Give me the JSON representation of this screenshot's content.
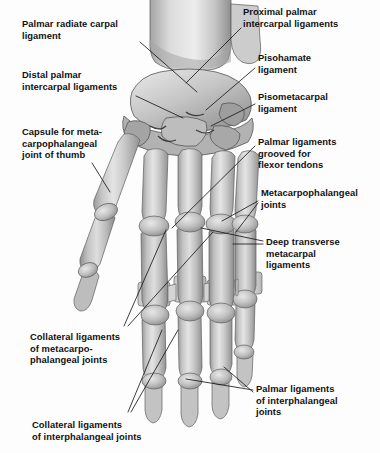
{
  "figure": {
    "background_color": "#fdfdfd",
    "text_color": "#111111",
    "bone_light": "#e2e2e2",
    "bone_mid": "#b8b8b8",
    "bone_dark": "#8e8e8e",
    "outline_color": "#4a4a4a",
    "leader_color": "#1a1a1a",
    "width": 380,
    "height": 453
  },
  "labels": [
    {
      "id": "palmar-radiate-carpal-ligament",
      "text": "Palmar radiate carpal\nligament",
      "side": "left",
      "x": 22,
      "y": 18
    },
    {
      "id": "distal-palmar-intercarpal-ligaments",
      "text": "Distal palmar\nintercarpal ligaments",
      "side": "left",
      "x": 22,
      "y": 69
    },
    {
      "id": "capsule-for-metacarpophalangeal-joint-of-thumb",
      "text": "Capsule for meta-\ncarpophalangeal\njoint of thumb",
      "side": "left",
      "x": 22,
      "y": 126
    },
    {
      "id": "collateral-ligaments-of-metacarpophalangeal-joints",
      "text": "Collateral ligaments\nof metacarpo-\nphalangeal joints",
      "side": "left",
      "x": 30,
      "y": 331
    },
    {
      "id": "collateral-ligaments-of-interphalangeal-joints",
      "text": "Collateral ligaments\nof interphalangeal joints",
      "side": "left",
      "x": 32,
      "y": 419
    },
    {
      "id": "proximal-palmar-intercarpal-ligaments",
      "text": "Proximal palmar\nintercarpal ligaments",
      "side": "right",
      "x": 243,
      "y": 6
    },
    {
      "id": "pisohamate-ligament",
      "text": "Pisohamate\nligament",
      "side": "right",
      "x": 258,
      "y": 52
    },
    {
      "id": "pisometacarpal-ligament",
      "text": "Pisometacarpal\nligament",
      "side": "right",
      "x": 258,
      "y": 91
    },
    {
      "id": "palmar-ligaments-grooved-for-flexor-tendons",
      "text": "Palmar ligaments\ngrooved for\nflexor tendons",
      "side": "right",
      "x": 258,
      "y": 136
    },
    {
      "id": "metacarpophalangeal-joints",
      "text": "Metacarpophalangeal\njoints",
      "side": "right",
      "x": 261,
      "y": 187
    },
    {
      "id": "deep-transverse-metacarpal-ligaments",
      "text": "Deep transverse\nmetacarpal\nligaments",
      "side": "right",
      "x": 266,
      "y": 236
    },
    {
      "id": "palmar-ligaments-of-interphalangeal-joints",
      "text": "Palmar ligaments\nof interphalangeal\njoints",
      "side": "right",
      "x": 256,
      "y": 383
    }
  ],
  "leader_lines": [
    {
      "id": "leader-palmar-radiate-carpal-ligament",
      "from_x": 140,
      "from_y": 42,
      "to_x": 197,
      "to_y": 92
    },
    {
      "id": "leader-distal-palmar-intercarpal-ligaments",
      "from_x": 136,
      "from_y": 96,
      "to_x": 183,
      "to_y": 118
    },
    {
      "id": "leader-capsule-mcp-thumb",
      "from_x": 92,
      "from_y": 163,
      "to_x": 110,
      "to_y": 192
    },
    {
      "id": "leader-collateral-mcp-a",
      "from_x": 124,
      "from_y": 326,
      "to_x": 166,
      "to_y": 230
    },
    {
      "id": "leader-collateral-mcp-b",
      "from_x": 128,
      "from_y": 326,
      "to_x": 213,
      "to_y": 232
    },
    {
      "id": "leader-collateral-ip-a",
      "from_x": 128,
      "from_y": 412,
      "to_x": 162,
      "to_y": 330
    },
    {
      "id": "leader-collateral-ip-b",
      "from_x": 131,
      "from_y": 412,
      "to_x": 178,
      "to_y": 330
    },
    {
      "id": "leader-proximal-palmar-intercarpal",
      "from_x": 241,
      "from_y": 28,
      "to_x": 186,
      "to_y": 83
    },
    {
      "id": "leader-pisohamate-ligament",
      "from_x": 255,
      "from_y": 68,
      "to_x": 206,
      "to_y": 110
    },
    {
      "id": "leader-pisometacarpal-ligament",
      "from_x": 255,
      "from_y": 104,
      "to_x": 211,
      "to_y": 126
    },
    {
      "id": "leader-palmar-ligaments-flexor",
      "from_x": 255,
      "from_y": 146,
      "to_x": 172,
      "to_y": 228
    },
    {
      "id": "leader-mcp-joints-a",
      "from_x": 258,
      "from_y": 201,
      "to_x": 222,
      "to_y": 221
    },
    {
      "id": "leader-mcp-joints-b",
      "from_x": 258,
      "from_y": 203,
      "to_x": 236,
      "to_y": 232
    },
    {
      "id": "leader-deep-transverse-a",
      "from_x": 263,
      "from_y": 241,
      "to_x": 201,
      "to_y": 228
    },
    {
      "id": "leader-deep-transverse-b",
      "from_x": 263,
      "from_y": 244,
      "to_x": 233,
      "to_y": 244
    },
    {
      "id": "leader-palmar-ip-joints-a",
      "from_x": 253,
      "from_y": 390,
      "to_x": 186,
      "to_y": 379
    },
    {
      "id": "leader-palmar-ip-joints-b",
      "from_x": 253,
      "from_y": 392,
      "to_x": 224,
      "to_y": 367
    }
  ],
  "anatomy": {
    "forearm_bones": [
      {
        "id": "radius",
        "label": "Radius"
      },
      {
        "id": "ulna",
        "label": "Ulna"
      }
    ],
    "carpal_mass": {
      "id": "carpal-bones",
      "label": "Carpal bones"
    },
    "rays": [
      {
        "id": "thumb-ray",
        "digit": 1,
        "label": "Thumb (pollex)"
      },
      {
        "id": "index-ray",
        "digit": 2,
        "label": "Index finger"
      },
      {
        "id": "middle-ray",
        "digit": 3,
        "label": "Middle finger"
      },
      {
        "id": "ring-ray",
        "digit": 4,
        "label": "Ring finger"
      },
      {
        "id": "little-ray",
        "digit": 5,
        "label": "Little finger"
      }
    ],
    "ligament_bands": [
      {
        "id": "palmar-band-index",
        "label": "Palmar ligament band, index MCP"
      },
      {
        "id": "palmar-band-middle",
        "label": "Palmar ligament band, middle MCP"
      },
      {
        "id": "palmar-band-ring",
        "label": "Palmar ligament band, ring MCP"
      },
      {
        "id": "palmar-band-little",
        "label": "Palmar ligament band, little MCP"
      }
    ]
  }
}
